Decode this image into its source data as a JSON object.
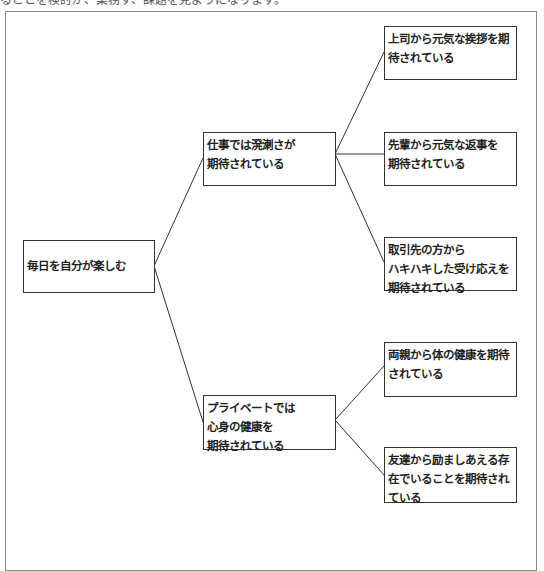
{
  "top_caption": "ることを検討が、業務す、課題を見ようになります。",
  "diagram": {
    "type": "logic-tree",
    "root": {
      "id": "root",
      "lines": [
        "毎日を自分が楽しむ"
      ]
    },
    "branches": [
      {
        "id": "mid1",
        "lines": [
          "仕事では溌溂さが",
          "期待されている"
        ],
        "children": [
          {
            "id": "leaf1",
            "lines": [
              "上司から元気な挨拶を期",
              "待されている"
            ]
          },
          {
            "id": "leaf2",
            "lines": [
              "先輩から元気な返事を",
              "期待されている"
            ]
          },
          {
            "id": "leaf3",
            "lines": [
              "取引先の方から",
              "ハキハキした受け応えを",
              "期待されている"
            ]
          }
        ]
      },
      {
        "id": "mid2",
        "lines": [
          "プライベートでは",
          "心身の健康を",
          "期待されている"
        ],
        "children": [
          {
            "id": "leaf4",
            "lines": [
              "両親から体の健康を期待",
              "されている"
            ]
          },
          {
            "id": "leaf5",
            "lines": [
              "友達から励ましあえる存",
              "在でいることを期待され",
              "ている"
            ]
          }
        ]
      }
    ]
  },
  "colors": {
    "box_border": "#333333",
    "line": "#333333",
    "frame": "#8a8a8a",
    "text": "#222222"
  }
}
